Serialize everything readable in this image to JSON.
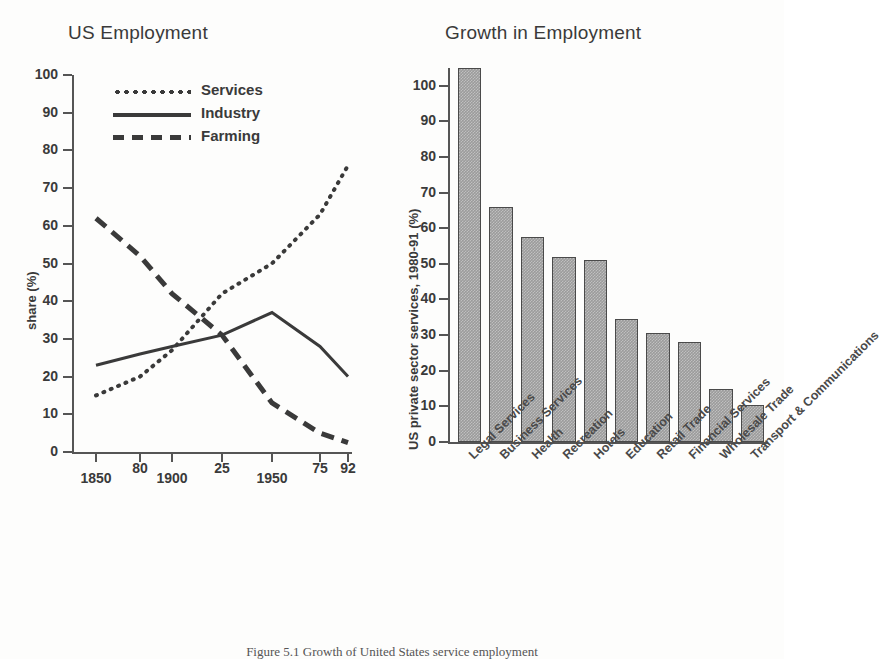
{
  "figure": {
    "caption": "Figure 5.1  Growth of United States service employment"
  },
  "chart_data": [
    {
      "type": "line",
      "title": "US Employment",
      "xlabel": "",
      "ylabel": "share (%)",
      "ylim": [
        0,
        100
      ],
      "yticks": [
        0,
        10,
        20,
        30,
        40,
        50,
        60,
        70,
        80,
        90,
        100
      ],
      "x": [
        1850,
        1880,
        1900,
        1925,
        1950,
        1975,
        1992
      ],
      "xtick_labels": [
        "1850",
        "80",
        "1900",
        "25",
        "1950",
        "75",
        "92"
      ],
      "grid": false,
      "legend_position": "top-center",
      "series": [
        {
          "name": "Services",
          "style": "dotted",
          "values": [
            15,
            20,
            27,
            42,
            50,
            63,
            76
          ]
        },
        {
          "name": "Industry",
          "style": "solid",
          "values": [
            23,
            26,
            28,
            31,
            37,
            28,
            20
          ]
        },
        {
          "name": "Farming",
          "style": "dashed",
          "values": [
            62,
            52,
            42,
            31,
            13,
            5,
            2.5
          ]
        }
      ]
    },
    {
      "type": "bar",
      "title": "Growth in Employment",
      "xlabel": "",
      "ylabel": "US private sector services, 1980-91 (%)",
      "ylim": [
        0,
        110
      ],
      "yticks": [
        0,
        10,
        20,
        30,
        40,
        50,
        60,
        70,
        80,
        90,
        100
      ],
      "grid": false,
      "bar_color": "#9b9b9b",
      "bar_edge_color": "#4a4a4a",
      "categories": [
        "Legal Services",
        "Business Services",
        "Health",
        "Recreation",
        "Hotels",
        "Education",
        "Retail Trade",
        "Financial Services",
        "Wholesale Trade",
        "Transport & Communications"
      ],
      "values": [
        105,
        66,
        57.5,
        52,
        51,
        34.5,
        30.5,
        28,
        15,
        10.5
      ]
    }
  ]
}
